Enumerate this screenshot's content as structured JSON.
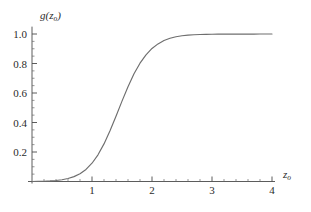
{
  "chart_data": {
    "type": "line",
    "title": "",
    "subtitle": "",
    "xlabel": "z_o",
    "xlabel_main": "z",
    "xlabel_sub": "o",
    "ylabel": "g(z_o)",
    "ylabel_main_open": "g(",
    "ylabel_var": "z",
    "ylabel_sub": "o",
    "ylabel_close": ")",
    "xlim": [
      0,
      4.05
    ],
    "ylim": [
      0,
      1.05
    ],
    "grid": false,
    "legend": null,
    "x_ticks": [
      1,
      2,
      3,
      4
    ],
    "x_tick_labels": [
      "1",
      "2",
      "3",
      "4"
    ],
    "x_minor_step": 0.2,
    "y_ticks": [
      0.2,
      0.4,
      0.6,
      0.8,
      1.0
    ],
    "y_tick_labels": [
      "0.2",
      "0.4",
      "0.6",
      "0.8",
      "1.0"
    ],
    "y_minor_step": 0.05,
    "curve_color": "#6e6e6e",
    "axis_color": "#4a4a4a",
    "background_color": "#ffffff",
    "series": [
      {
        "name": "g(z_o)",
        "x": [
          0.0,
          0.1,
          0.2,
          0.3,
          0.4,
          0.5,
          0.6,
          0.7,
          0.8,
          0.9,
          1.0,
          1.1,
          1.2,
          1.3,
          1.4,
          1.5,
          1.6,
          1.7,
          1.8,
          1.9,
          2.0,
          2.1,
          2.2,
          2.3,
          2.4,
          2.5,
          2.6,
          2.7,
          2.8,
          2.9,
          3.0,
          3.1,
          3.2,
          3.3,
          3.4,
          3.5,
          3.6,
          3.7,
          3.8,
          3.9,
          4.0
        ],
        "y": [
          0.0,
          0.001,
          0.002,
          0.004,
          0.007,
          0.012,
          0.02,
          0.033,
          0.053,
          0.082,
          0.124,
          0.181,
          0.255,
          0.344,
          0.443,
          0.545,
          0.643,
          0.73,
          0.802,
          0.859,
          0.902,
          0.933,
          0.956,
          0.971,
          0.981,
          0.988,
          0.992,
          0.995,
          0.9965,
          0.9975,
          0.9982,
          0.9987,
          0.999,
          0.9992,
          0.9993,
          0.9994,
          0.9995,
          0.9996,
          0.9997,
          0.9997,
          0.9998
        ]
      }
    ]
  }
}
